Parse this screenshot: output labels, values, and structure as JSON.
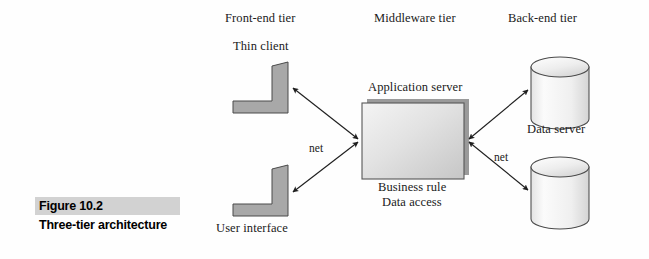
{
  "figure": {
    "number": "Figure 10.2",
    "title": "Three-tier architecture"
  },
  "tiers": [
    {
      "id": "front-end",
      "label": "Front-end tier"
    },
    {
      "id": "middleware",
      "label": "Middleware tier"
    },
    {
      "id": "back-end",
      "label": "Back-end tier"
    }
  ],
  "nodes": {
    "thin_client": {
      "label": "Thin client",
      "icon": "workstation-icon"
    },
    "user_interface": {
      "label": "User interface",
      "icon": "workstation-icon"
    },
    "application_server": {
      "label": "Application server",
      "sublabel_line1": "Business rule",
      "sublabel_line2": "Data access",
      "icon": "server-box-icon"
    },
    "data_server": {
      "label": "Data server",
      "icon": "database-cylinder-icon"
    },
    "second_database": {
      "label": "",
      "icon": "database-cylinder-icon"
    }
  },
  "connections": [
    {
      "id": "thin-client-to-server",
      "label": "net",
      "arrow": "double"
    },
    {
      "id": "user-interface-to-server",
      "label": "",
      "arrow": "double"
    },
    {
      "id": "server-to-data-server",
      "label": "",
      "arrow": "double"
    },
    {
      "id": "server-to-second-database",
      "label": "net",
      "arrow": "double"
    }
  ],
  "colors": {
    "shape_fill": "#a8a8a8",
    "box_fill_light": "#f2f2f2",
    "box_fill_dark": "#c9c9c9",
    "box_shadow": "#9a9a9a",
    "cylinder_fill": "#f0f0f0",
    "caption_band": "#d2d2d2",
    "stroke": "#1f1f1f",
    "background": "#fefefe"
  }
}
